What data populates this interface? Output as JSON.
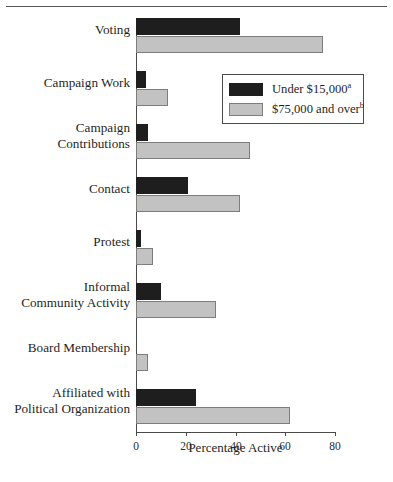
{
  "chart_data": {
    "type": "bar",
    "orientation": "horizontal",
    "title": "",
    "xlabel": "Percentage Active",
    "ylabel": "",
    "xlim": [
      0,
      80
    ],
    "xticks": [
      0,
      20,
      40,
      60,
      80
    ],
    "grid": false,
    "legend_position": "inside-upper-right",
    "categories": [
      "Voting",
      "Campaign Work",
      "Campaign\nContributions",
      "Contact",
      "Protest",
      "Informal\nCommunity Activity",
      "Board Membership",
      "Affiliated with\nPolitical Organization"
    ],
    "series": [
      {
        "name": "Under $15,000",
        "note_marker": "a",
        "color": "#1e1e1e",
        "values": [
          42,
          4,
          5,
          21,
          2,
          10,
          0,
          24
        ]
      },
      {
        "name": "$75,000 and over",
        "note_marker": "b",
        "color": "#c2c2c2",
        "values": [
          75,
          13,
          46,
          42,
          7,
          32,
          5,
          62
        ]
      }
    ]
  },
  "axis": {
    "tick_labels": [
      "0",
      "20",
      "40",
      "60",
      "80"
    ],
    "x_title": "Percentage Active"
  },
  "categories": [
    {
      "lines": [
        "Voting"
      ]
    },
    {
      "lines": [
        "Campaign Work"
      ]
    },
    {
      "lines": [
        "Campaign",
        "Contributions"
      ]
    },
    {
      "lines": [
        "Contact"
      ]
    },
    {
      "lines": [
        "Protest"
      ]
    },
    {
      "lines": [
        "Informal",
        "Community Activity"
      ]
    },
    {
      "lines": [
        "Board Membership"
      ]
    },
    {
      "lines": [
        "Affiliated with",
        "Political Organization"
      ]
    }
  ],
  "legend": {
    "entries": [
      {
        "label": "Under $15,000",
        "marker": "a",
        "swatch": "dark"
      },
      {
        "label": "$75,000 and over",
        "marker": "b",
        "swatch": "light"
      }
    ]
  },
  "colors": {
    "series_dark": "#1e1e1e",
    "series_light": "#c2c2c2",
    "axis": "#4a4a4a",
    "rule": "#555555",
    "background": "#ffffff"
  }
}
